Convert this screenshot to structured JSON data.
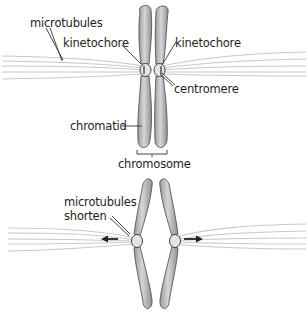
{
  "diagram": {
    "panels": [
      {
        "id": "top",
        "labels": {
          "microtubules": "microtubules",
          "kinetochore_left": "kinetochore",
          "kinetochore_right": "kinetochore",
          "centromere": "centromere",
          "chromatid": "chromatid",
          "chromosome": "chromosome"
        }
      },
      {
        "id": "bottom",
        "labels": {
          "microtubules_shorten_line1": "microtubules",
          "microtubules_shorten_line2": "shorten"
        },
        "arrows": [
          "left-arrow",
          "right-arrow"
        ]
      }
    ],
    "colors": {
      "chromatid_fill": "#b5b5b5",
      "chromatid_stroke": "#555555",
      "microtubule": "#c8c8c8",
      "text": "#1e1e1e",
      "leader_line": "#333333"
    }
  }
}
